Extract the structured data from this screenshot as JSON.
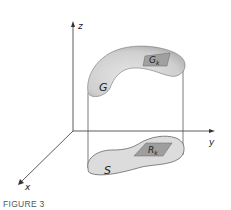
{
  "figure": {
    "caption": "FIGURE 3",
    "axes": {
      "x": "x",
      "y": "y",
      "z": "z"
    },
    "regions": {
      "solid_surface": "G",
      "surface_patch": {
        "base": "G",
        "sub": "k"
      },
      "shadow_region": "S",
      "region_patch": {
        "base": "R",
        "sub": "k"
      }
    },
    "colors": {
      "axis": "#333333",
      "surface_fill": "#d4d4d4",
      "surface_shadow": "#a9a9a9",
      "shadow_fill": "#dcdcdc",
      "patch_fill": "#9e9e9e",
      "caption": "#555555"
    }
  }
}
